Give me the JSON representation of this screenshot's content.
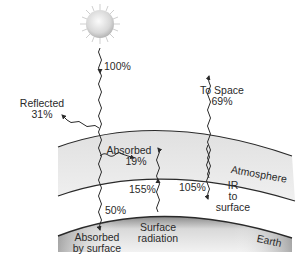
{
  "diagram": {
    "sun": {
      "label": "100%"
    },
    "reflected": {
      "title": "Reflected",
      "value": "31%"
    },
    "to_space": {
      "title": "To Space",
      "value": "69%"
    },
    "absorbed_atmosphere": {
      "title": "Absorbed",
      "value": "19%"
    },
    "absorbed_surface": {
      "line1": "Absorbed",
      "line2": "by surface",
      "value": "50%"
    },
    "surface_radiation": {
      "line1": "Surface",
      "line2": "radiation",
      "value": "155%"
    },
    "ir_to_surface": {
      "line1": "IR",
      "line2": "to",
      "line3": "surface",
      "value": "105%"
    },
    "layers": {
      "atmosphere": "Atmosphere",
      "earth": "Earth"
    },
    "colors": {
      "atmosphere_fill": "#e4e4e4",
      "earth_top": "#f2f2f2",
      "earth_bottom": "#8c8c8c",
      "line": "#2a2a2a",
      "sun_core": "#f4f4f4",
      "sun_edge": "#b8b8b8"
    }
  }
}
